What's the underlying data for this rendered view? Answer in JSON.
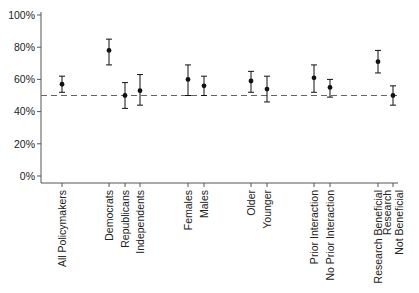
{
  "chart_data": {
    "type": "scatter",
    "subtype": "point-estimate-with-error-bars",
    "title": "",
    "xlabel": "",
    "ylabel": "",
    "ylim": [
      0,
      100
    ],
    "y_ticks": [
      0,
      20,
      40,
      60,
      80,
      100
    ],
    "y_tick_labels": [
      "0%",
      "20%",
      "40%",
      "60%",
      "80%",
      "100%"
    ],
    "reference_line": {
      "value": 50,
      "style": "dashed"
    },
    "grid": false,
    "legend": null,
    "categories": [
      "All Policymakers",
      "Democrats",
      "Republicans",
      "Independents",
      "Females",
      "Males",
      "Older",
      "Younger",
      "Prior Interaction",
      "No Prior Interaction",
      "Research Beneficial",
      "Research\nNot Beneficial"
    ],
    "points": [
      {
        "label": "All Policymakers",
        "value": 57,
        "ci_low": 52,
        "ci_high": 62
      },
      {
        "label": "Democrats",
        "value": 78,
        "ci_low": 69,
        "ci_high": 85
      },
      {
        "label": "Republicans",
        "value": 50,
        "ci_low": 42,
        "ci_high": 58
      },
      {
        "label": "Independents",
        "value": 53,
        "ci_low": 44,
        "ci_high": 63
      },
      {
        "label": "Females",
        "value": 60,
        "ci_low": 50,
        "ci_high": 69
      },
      {
        "label": "Males",
        "value": 56,
        "ci_low": 50,
        "ci_high": 62
      },
      {
        "label": "Older",
        "value": 59,
        "ci_low": 52,
        "ci_high": 65
      },
      {
        "label": "Younger",
        "value": 54,
        "ci_low": 46,
        "ci_high": 62
      },
      {
        "label": "Prior Interaction",
        "value": 61,
        "ci_low": 52,
        "ci_high": 69
      },
      {
        "label": "No Prior Interaction",
        "value": 55,
        "ci_low": 49,
        "ci_high": 60
      },
      {
        "label": "Research Beneficial",
        "value": 71,
        "ci_low": 64,
        "ci_high": 78
      },
      {
        "label": "Research Not Beneficial",
        "value": 50,
        "ci_low": 44,
        "ci_high": 56
      }
    ]
  },
  "layout": {
    "x_positions": [
      62,
      109,
      125,
      140,
      188,
      204,
      251,
      267,
      314,
      330,
      378,
      393
    ],
    "category_lines": [
      [
        "All Policymakers"
      ],
      [
        "Democrats"
      ],
      [
        "Republicans"
      ],
      [
        "Independents"
      ],
      [
        "Females"
      ],
      [
        "Males"
      ],
      [
        "Older"
      ],
      [
        "Younger"
      ],
      [
        "Prior Interaction"
      ],
      [
        "No Prior Interaction"
      ],
      [
        "Research Beneficial"
      ],
      [
        "Research",
        "Not Beneficial"
      ]
    ]
  },
  "colors": {
    "point": "#111111",
    "axis": "#555555",
    "reference_line": "#666666",
    "text": "#222222"
  }
}
